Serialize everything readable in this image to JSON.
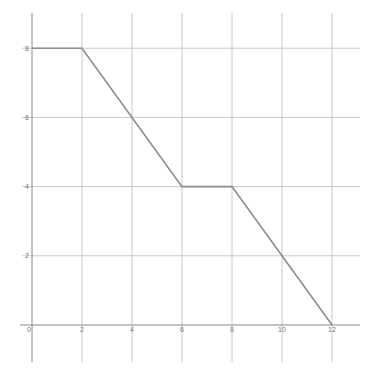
{
  "chart_data": {
    "type": "line",
    "title": "",
    "xlabel": "",
    "ylabel": "",
    "x": [
      0,
      2,
      6,
      8,
      12
    ],
    "series": [
      {
        "name": "",
        "values": [
          8,
          8,
          4,
          4,
          0
        ]
      }
    ],
    "x_ticks": [
      "0",
      "2",
      "4",
      "6",
      "8",
      "10",
      "12"
    ],
    "y_ticks": [
      "2",
      "4",
      "6",
      "8"
    ],
    "xlim": [
      0,
      13
    ],
    "ylim": [
      0,
      8.5
    ],
    "grid": true,
    "legend": null
  },
  "colors": {
    "grid": "#c8c8c8",
    "axis": "#8a8a8a",
    "line": "#8c8c8c",
    "label": "#777777"
  }
}
